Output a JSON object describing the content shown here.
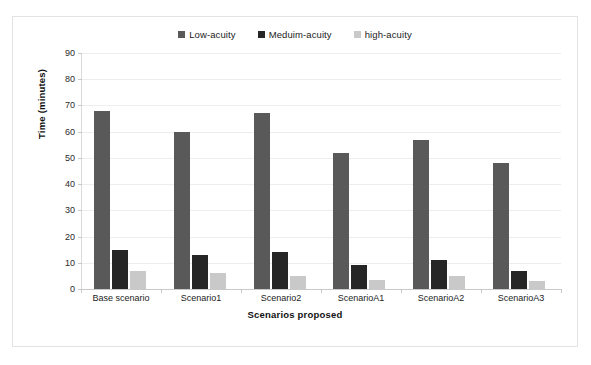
{
  "scan": {
    "top_cut_text": "",
    "bottom_cut_text": ""
  },
  "chart_data": {
    "type": "bar",
    "title": "",
    "subtitle": "",
    "xlabel": "Scenarios proposed",
    "ylabel": "Time (minutes)",
    "categories": [
      "Base scenario",
      "Scenario1",
      "Scenario2",
      "ScenarioA1",
      "ScenarioA2",
      "ScenarioA3"
    ],
    "series": [
      {
        "name": "Low-acuity",
        "color": "#595959",
        "values": [
          68,
          60,
          67,
          52,
          57,
          48
        ]
      },
      {
        "name": "Meduim-acuity",
        "color": "#262626",
        "values": [
          15,
          13,
          14,
          9,
          11,
          7
        ]
      },
      {
        "name": "high-acuity",
        "color": "#c9c9c9",
        "values": [
          7,
          6,
          5,
          3.5,
          5,
          3
        ]
      }
    ],
    "ylim": [
      0,
      90
    ],
    "yticks": [
      90,
      80,
      70,
      60,
      50,
      40,
      30,
      20,
      10,
      0
    ],
    "ytick_labels": [
      "90",
      "80",
      "70",
      "60",
      "50",
      "40",
      "30",
      "20",
      "10",
      "0"
    ],
    "grid": true,
    "legend_position": "top-center"
  }
}
